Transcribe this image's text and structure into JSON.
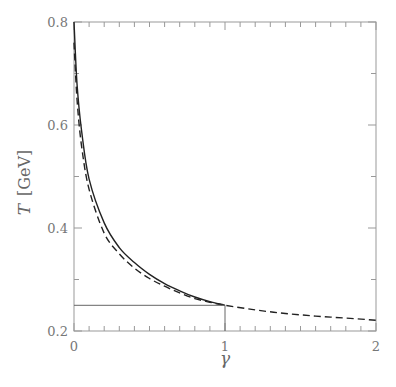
{
  "chart_data": {
    "type": "line",
    "title": "",
    "xlabel": "γ",
    "ylabel": "T [GeV]",
    "ylabel_symbol": "T",
    "ylabel_unit": "[GeV]",
    "xlim": [
      0,
      2
    ],
    "ylim": [
      0.2,
      0.8
    ],
    "xticks": [
      "0",
      "1",
      "2"
    ],
    "yticks": [
      "0.2",
      "0.4",
      "0.6",
      "0.8"
    ],
    "grid": false,
    "legend": null,
    "series": [
      {
        "name": "solid curve",
        "style": "solid",
        "x": [
          0.0,
          0.02,
          0.05,
          0.1,
          0.2,
          0.3,
          0.4,
          0.5,
          0.6,
          0.7,
          0.8,
          0.9,
          1.0
        ],
        "y": [
          0.8,
          0.68,
          0.59,
          0.495,
          0.41,
          0.362,
          0.333,
          0.31,
          0.292,
          0.278,
          0.266,
          0.257,
          0.25
        ]
      },
      {
        "name": "dashed curve",
        "style": "dashed",
        "x": [
          0.0,
          0.02,
          0.05,
          0.1,
          0.2,
          0.3,
          0.4,
          0.5,
          0.6,
          0.7,
          0.8,
          0.9,
          1.0,
          1.2,
          1.4,
          1.6,
          1.8,
          2.0
        ],
        "y": [
          0.76,
          0.65,
          0.56,
          0.475,
          0.39,
          0.35,
          0.322,
          0.302,
          0.287,
          0.274,
          0.263,
          0.256,
          0.25,
          0.241,
          0.234,
          0.229,
          0.225,
          0.221
        ]
      },
      {
        "name": "horizontal reference line",
        "style": "solid-thin",
        "x": [
          0.0,
          1.0
        ],
        "y": [
          0.25,
          0.25
        ]
      },
      {
        "name": "vertical reference line",
        "style": "solid-thin",
        "x": [
          1.0,
          1.0
        ],
        "y": [
          0.2,
          0.25
        ]
      }
    ],
    "colors": {
      "curve": "#222222",
      "axis": "#999999",
      "text": "#777777"
    }
  }
}
